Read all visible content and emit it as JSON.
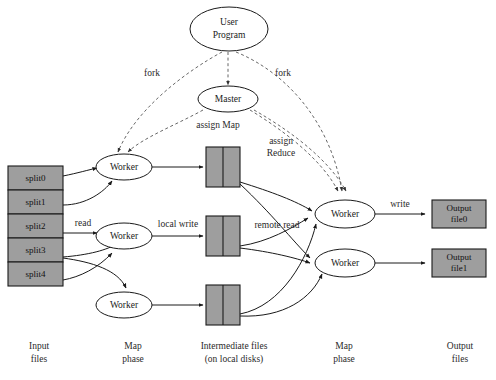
{
  "diagram": {
    "colors": {
      "file_fill": "#9e9e9e",
      "node_fill": "#ffffff",
      "stroke": "#1a1a1a",
      "dashed_stroke": "#555555",
      "background": "#ffffff"
    },
    "nodes": {
      "user_program": {
        "label_line1": "User",
        "label_line2": "Program"
      },
      "master": {
        "label": "Master"
      },
      "map_workers": [
        {
          "label": "Worker"
        },
        {
          "label": "Worker"
        },
        {
          "label": "Worker"
        }
      ],
      "reduce_workers": [
        {
          "label": "Worker"
        },
        {
          "label": "Worker"
        }
      ]
    },
    "input_files": {
      "splits": [
        {
          "label": "split0"
        },
        {
          "label": "split1"
        },
        {
          "label": "split2"
        },
        {
          "label": "split3"
        },
        {
          "label": "split4"
        }
      ]
    },
    "intermediate_files": [
      {
        "label": ""
      },
      {
        "label": ""
      },
      {
        "label": ""
      }
    ],
    "output_files": [
      {
        "label_line1": "Output",
        "label_line2": "file0"
      },
      {
        "label_line1": "Output",
        "label_line2": "file1"
      }
    ],
    "edge_labels": {
      "fork_left": "fork",
      "fork_right": "fork",
      "assign_map": "assign Map",
      "assign_reduce_line1": "assign",
      "assign_reduce_line2": "Reduce",
      "read": "read",
      "local_write": "local write",
      "remote_read": "remote read",
      "write": "write"
    },
    "phase_labels": [
      {
        "line1": "Input",
        "line2": "files"
      },
      {
        "line1": "Map",
        "line2": "phase"
      },
      {
        "line1": "Intermediate files",
        "line2": "(on local disks)"
      },
      {
        "line1": "Map",
        "line2": "phase"
      },
      {
        "line1": "Output",
        "line2": "files"
      }
    ]
  }
}
